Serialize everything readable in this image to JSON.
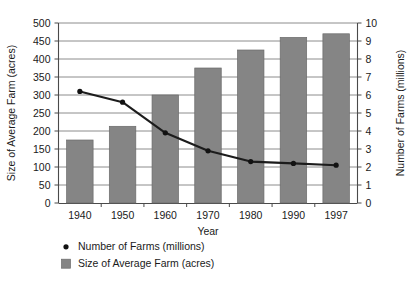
{
  "chart_data": {
    "type": "bar",
    "title": "",
    "subtitle": "",
    "xlabel": "Year",
    "ylabel": "Size of Average Farm (acres)",
    "y2label": "Number of Farms (millions)",
    "categories": [
      "1940",
      "1950",
      "1960",
      "1970",
      "1980",
      "1990",
      "1997"
    ],
    "ylim": [
      0,
      500
    ],
    "y2lim": [
      0,
      10
    ],
    "yticks": [
      "0",
      "50",
      "100",
      "150",
      "200",
      "250",
      "300",
      "350",
      "400",
      "450",
      "500"
    ],
    "ytick_values": [
      0,
      50,
      100,
      150,
      200,
      250,
      300,
      350,
      400,
      450,
      500
    ],
    "y2ticks": [
      "0",
      "1",
      "2",
      "3",
      "4",
      "5",
      "6",
      "7",
      "8",
      "9",
      "10"
    ],
    "y2tick_values": [
      0,
      1,
      2,
      3,
      4,
      5,
      6,
      7,
      8,
      9,
      10
    ],
    "grid": true,
    "legend_position": "bottom-left",
    "series": [
      {
        "name": "Size of Average Farm (acres)",
        "type": "bar",
        "axis": "left",
        "color": "#858585",
        "values": [
          175,
          213,
          300,
          375,
          425,
          460,
          470
        ]
      },
      {
        "name": "Number of Farms (millions)",
        "type": "line",
        "axis": "right",
        "color": "#121212",
        "values": [
          6.2,
          5.6,
          3.9,
          2.9,
          2.3,
          2.2,
          2.1
        ]
      }
    ]
  },
  "legend": {
    "items": [
      {
        "label": "Number of Farms (millions)",
        "marker": "dot",
        "color": "#121212"
      },
      {
        "label": "Size of Average Farm (acres)",
        "marker": "square",
        "color": "#858585"
      }
    ]
  }
}
